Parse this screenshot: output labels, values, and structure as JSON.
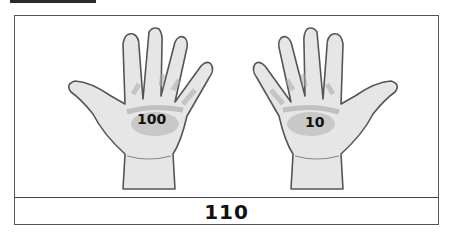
{
  "figure": {
    "left_hand": {
      "label": "100",
      "description": "left-hand-palm"
    },
    "right_hand": {
      "label": "10",
      "description": "right-hand-palm"
    },
    "total": "110"
  },
  "colors": {
    "skin": "#e4e4e4",
    "shade": "#b8b8b8",
    "outline": "#555555",
    "border": "#555555"
  }
}
